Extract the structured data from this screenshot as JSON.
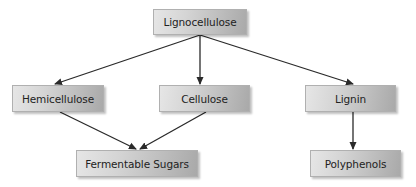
{
  "diagram": {
    "type": "flowchart",
    "nodes": [
      {
        "id": "lignocellulose",
        "label": "Lignocellulose",
        "x": 153,
        "y": 9,
        "w": 94,
        "h": 26
      },
      {
        "id": "hemicellulose",
        "label": "Hemicellulose",
        "x": 12,
        "y": 85,
        "w": 92,
        "h": 27
      },
      {
        "id": "cellulose",
        "label": "Cellulose",
        "x": 159,
        "y": 85,
        "w": 91,
        "h": 27
      },
      {
        "id": "lignin",
        "label": "Lignin",
        "x": 305,
        "y": 85,
        "w": 91,
        "h": 27
      },
      {
        "id": "fermentable_sugars",
        "label": "Fermentable Sugars",
        "x": 76,
        "y": 150,
        "w": 122,
        "h": 27
      },
      {
        "id": "polyphenols",
        "label": "Polyphenols",
        "x": 310,
        "y": 150,
        "w": 91,
        "h": 27
      }
    ],
    "edges": [
      {
        "from": "lignocellulose",
        "to": "hemicellulose",
        "x1": 200,
        "y1": 35,
        "x2": 55,
        "y2": 84
      },
      {
        "from": "lignocellulose",
        "to": "cellulose",
        "x1": 200,
        "y1": 35,
        "x2": 200,
        "y2": 84
      },
      {
        "from": "lignocellulose",
        "to": "lignin",
        "x1": 200,
        "y1": 35,
        "x2": 353,
        "y2": 84
      },
      {
        "from": "hemicellulose",
        "to": "fermentable_sugars",
        "x1": 60,
        "y1": 112,
        "x2": 136,
        "y2": 149
      },
      {
        "from": "cellulose",
        "to": "fermentable_sugars",
        "x1": 206,
        "y1": 112,
        "x2": 140,
        "y2": 149
      },
      {
        "from": "lignin",
        "to": "polyphenols",
        "x1": 353,
        "y1": 112,
        "x2": 353,
        "y2": 149
      }
    ],
    "colors": {
      "arrow": "#2a2a2a",
      "box_light": "#e6e6e6",
      "box_dark": "#a9a9a9",
      "text": "#222222"
    }
  }
}
